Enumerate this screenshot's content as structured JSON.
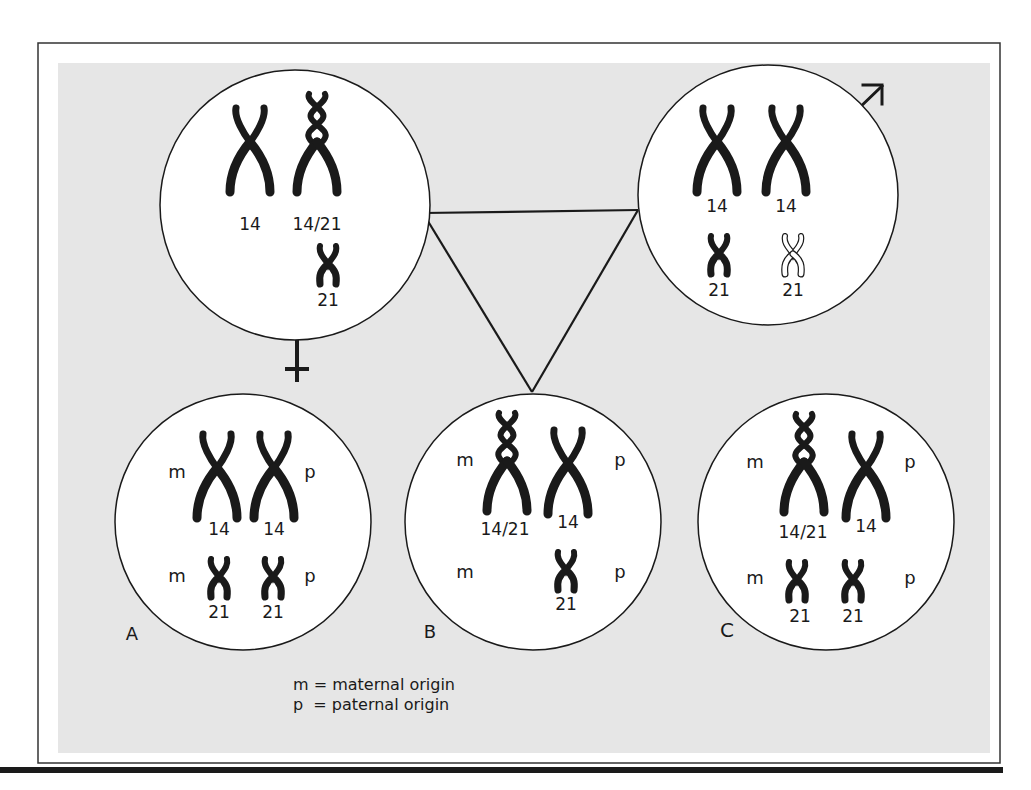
{
  "figure": {
    "colors": {
      "panel": "#e6e6e6",
      "ink": "#1a1a1a",
      "circle_fill": "#ffffff"
    },
    "parents": {
      "female": {
        "symbol": "female-symbol",
        "chromosomes": [
          {
            "label": "14",
            "type": "normal",
            "origin": ""
          },
          {
            "label": "14/21",
            "type": "translocation",
            "origin": ""
          },
          {
            "label": "21",
            "type": "small",
            "origin": ""
          }
        ]
      },
      "male": {
        "symbol": "male-symbol",
        "chromosomes": [
          {
            "label": "14",
            "type": "normal"
          },
          {
            "label": "14",
            "type": "normal"
          },
          {
            "label": "21",
            "type": "small"
          },
          {
            "label": "21",
            "type": "small-outline"
          }
        ]
      }
    },
    "offspring": [
      {
        "id": "A",
        "rows": [
          {
            "left_origin": "m",
            "right_origin": "p",
            "chromosomes": [
              "14",
              "14"
            ]
          },
          {
            "left_origin": "m",
            "right_origin": "p",
            "chromosomes": [
              "21",
              "21"
            ]
          }
        ]
      },
      {
        "id": "B",
        "rows": [
          {
            "left_origin": "m",
            "right_origin": "p",
            "chromosomes": [
              "14/21",
              "14"
            ]
          },
          {
            "left_origin": "m",
            "right_origin": "p",
            "chromosomes": [
              "21"
            ]
          }
        ]
      },
      {
        "id": "C",
        "rows": [
          {
            "left_origin": "m",
            "right_origin": "p",
            "chromosomes": [
              "14/21",
              "14"
            ]
          },
          {
            "left_origin": "m",
            "right_origin": "p",
            "chromosomes": [
              "21",
              "21"
            ]
          }
        ]
      }
    ],
    "legend": {
      "line1": "m = maternal origin",
      "line2": "p  = paternal origin"
    }
  }
}
